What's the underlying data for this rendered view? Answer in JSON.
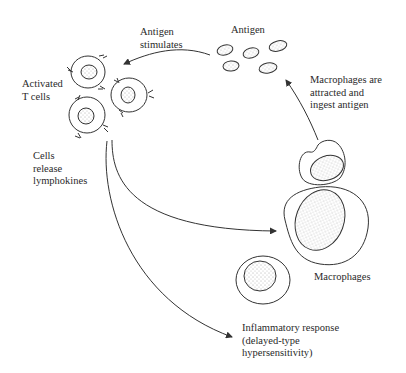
{
  "labels": {
    "antigen": "Antigen",
    "antigen_stimulates": "Antigen\nstimulates",
    "activated_t_cells": "Activated\nT cells",
    "cells_release": "Cells\nrelease\nlymphokines",
    "macrophages_attracted": "Macrophages are\nattracted and\ningest antigen",
    "macrophages": "Macrophages",
    "inflammatory": "Inflammatory response\n(delayed-type\nhypersensitivity)"
  },
  "colors": {
    "stroke": "#333333",
    "background": "#ffffff"
  }
}
